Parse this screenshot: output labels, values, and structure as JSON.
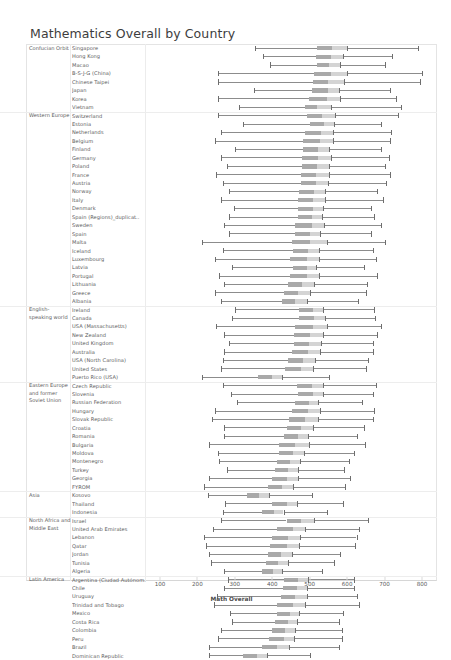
{
  "title": "Mathematics Overall by Country",
  "axis": {
    "label": "Math Overall",
    "ticks": [
      100,
      200,
      300,
      400,
      500,
      600,
      700,
      800
    ],
    "min": 60,
    "max": 840
  },
  "colors": {
    "line": "#8c8c8c",
    "box": "#9a9a9a",
    "cap": "#6e6e6e",
    "grid": "#ececec",
    "text": "#5a5a5a"
  },
  "chart_data": {
    "type": "bar",
    "title": "Mathematics Overall by Country",
    "xlabel": "Math Overall",
    "ylabel": "",
    "xlim": [
      60,
      840
    ],
    "grid": false,
    "legend": "none",
    "note": "Horizontal range chart: each row shows low cap, an inter-quartile box, and a high cap for one country, grouped by region.",
    "groups": [
      {
        "group": "Confucian Orbit",
        "rows": [
          {
            "country": "Singapore",
            "low": 355,
            "box_start": 520,
            "box_end": 560,
            "mid_gap_end": 600,
            "high": 790
          },
          {
            "country": "Hong Kong",
            "low": 375,
            "box_start": 518,
            "box_end": 556,
            "mid_gap_end": 588,
            "high": 720
          },
          {
            "country": "Macao",
            "low": 395,
            "box_start": 520,
            "box_end": 552,
            "mid_gap_end": 582,
            "high": 700
          },
          {
            "country": "B-S-J-G (China)",
            "low": 255,
            "box_start": 512,
            "box_end": 556,
            "mid_gap_end": 600,
            "high": 800
          },
          {
            "country": "Chinese Taipei",
            "low": 255,
            "box_start": 508,
            "box_end": 548,
            "mid_gap_end": 592,
            "high": 795
          },
          {
            "country": "Japan",
            "low": 350,
            "box_start": 505,
            "box_end": 548,
            "mid_gap_end": 578,
            "high": 715
          },
          {
            "country": "Korea",
            "low": 255,
            "box_start": 498,
            "box_end": 545,
            "mid_gap_end": 580,
            "high": 730
          },
          {
            "country": "Vietnam",
            "low": 310,
            "box_start": 488,
            "box_end": 520,
            "mid_gap_end": 556,
            "high": 745
          }
        ]
      },
      {
        "group": "Western Europe",
        "rows": [
          {
            "country": "Switzerland",
            "low": 255,
            "box_start": 492,
            "box_end": 532,
            "mid_gap_end": 568,
            "high": 735
          },
          {
            "country": "Estonia",
            "low": 322,
            "box_start": 500,
            "box_end": 538,
            "mid_gap_end": 565,
            "high": 690
          },
          {
            "country": "Netherlands",
            "low": 262,
            "box_start": 488,
            "box_end": 530,
            "mid_gap_end": 562,
            "high": 718
          },
          {
            "country": "Belgium",
            "low": 248,
            "box_start": 482,
            "box_end": 528,
            "mid_gap_end": 562,
            "high": 715
          },
          {
            "country": "Finland",
            "low": 300,
            "box_start": 482,
            "box_end": 522,
            "mid_gap_end": 552,
            "high": 690
          },
          {
            "country": "Germany",
            "low": 262,
            "box_start": 480,
            "box_end": 522,
            "mid_gap_end": 556,
            "high": 712
          },
          {
            "country": "Poland",
            "low": 278,
            "box_start": 480,
            "box_end": 520,
            "mid_gap_end": 552,
            "high": 700
          },
          {
            "country": "France",
            "low": 250,
            "box_start": 478,
            "box_end": 518,
            "mid_gap_end": 552,
            "high": 715
          },
          {
            "country": "Austria",
            "low": 268,
            "box_start": 478,
            "box_end": 518,
            "mid_gap_end": 550,
            "high": 705
          },
          {
            "country": "Norway",
            "low": 285,
            "box_start": 472,
            "box_end": 512,
            "mid_gap_end": 542,
            "high": 680
          },
          {
            "country": "Italy",
            "low": 262,
            "box_start": 468,
            "box_end": 508,
            "mid_gap_end": 540,
            "high": 695
          },
          {
            "country": "Denmark",
            "low": 298,
            "box_start": 470,
            "box_end": 508,
            "mid_gap_end": 535,
            "high": 665
          },
          {
            "country": "Spain (Regions)_duplicat..",
            "low": 285,
            "box_start": 468,
            "box_end": 505,
            "mid_gap_end": 532,
            "high": 672
          },
          {
            "country": "Sweden",
            "low": 272,
            "box_start": 462,
            "box_end": 505,
            "mid_gap_end": 538,
            "high": 690
          },
          {
            "country": "Spain",
            "low": 285,
            "box_start": 462,
            "box_end": 500,
            "mid_gap_end": 528,
            "high": 665
          },
          {
            "country": "Malta",
            "low": 212,
            "box_start": 452,
            "box_end": 502,
            "mid_gap_end": 545,
            "high": 700
          },
          {
            "country": "Iceland",
            "low": 268,
            "box_start": 455,
            "box_end": 495,
            "mid_gap_end": 525,
            "high": 668
          },
          {
            "country": "Luxembourg",
            "low": 248,
            "box_start": 448,
            "box_end": 492,
            "mid_gap_end": 525,
            "high": 678
          },
          {
            "country": "Latvia",
            "low": 292,
            "box_start": 455,
            "box_end": 492,
            "mid_gap_end": 518,
            "high": 645
          },
          {
            "country": "Portugal",
            "low": 258,
            "box_start": 448,
            "box_end": 492,
            "mid_gap_end": 525,
            "high": 680
          },
          {
            "country": "Lithuania",
            "low": 272,
            "box_start": 442,
            "box_end": 480,
            "mid_gap_end": 512,
            "high": 652
          },
          {
            "country": "Greece",
            "low": 248,
            "box_start": 430,
            "box_end": 470,
            "mid_gap_end": 502,
            "high": 650
          },
          {
            "country": "Albania",
            "low": 262,
            "box_start": 425,
            "box_end": 462,
            "mid_gap_end": 492,
            "high": 630
          }
        ]
      },
      {
        "group": "English-speaking world",
        "rows": [
          {
            "country": "Ireland",
            "low": 300,
            "box_start": 472,
            "box_end": 508,
            "mid_gap_end": 535,
            "high": 672
          },
          {
            "country": "Canada",
            "low": 292,
            "box_start": 472,
            "box_end": 512,
            "mid_gap_end": 542,
            "high": 675
          },
          {
            "country": "USA (Massachusetts)",
            "low": 250,
            "box_start": 462,
            "box_end": 508,
            "mid_gap_end": 545,
            "high": 690
          },
          {
            "country": "New Zealand",
            "low": 272,
            "box_start": 458,
            "box_end": 500,
            "mid_gap_end": 535,
            "high": 680
          },
          {
            "country": "United Kingdom",
            "low": 285,
            "box_start": 458,
            "box_end": 498,
            "mid_gap_end": 530,
            "high": 668
          },
          {
            "country": "Australia",
            "low": 272,
            "box_start": 452,
            "box_end": 495,
            "mid_gap_end": 528,
            "high": 670
          },
          {
            "country": "USA (North Carolina)",
            "low": 268,
            "box_start": 442,
            "box_end": 482,
            "mid_gap_end": 515,
            "high": 655
          },
          {
            "country": "United States",
            "low": 262,
            "box_start": 435,
            "box_end": 478,
            "mid_gap_end": 510,
            "high": 650
          },
          {
            "country": "Puerto Rico (USA)",
            "low": 212,
            "box_start": 362,
            "box_end": 398,
            "mid_gap_end": 425,
            "high": 552
          }
        ]
      },
      {
        "group": "Eastern Europe and former Soviet Union",
        "rows": [
          {
            "country": "Czech Republic",
            "low": 268,
            "box_start": 465,
            "box_end": 505,
            "mid_gap_end": 535,
            "high": 678
          },
          {
            "country": "Slovenia",
            "low": 290,
            "box_start": 468,
            "box_end": 508,
            "mid_gap_end": 535,
            "high": 668
          },
          {
            "country": "Russian Federation",
            "low": 305,
            "box_start": 462,
            "box_end": 498,
            "mid_gap_end": 522,
            "high": 640
          },
          {
            "country": "Hungary",
            "low": 248,
            "box_start": 452,
            "box_end": 495,
            "mid_gap_end": 528,
            "high": 672
          },
          {
            "country": "Slovak Republic",
            "low": 238,
            "box_start": 445,
            "box_end": 488,
            "mid_gap_end": 522,
            "high": 668
          },
          {
            "country": "Croatia",
            "low": 272,
            "box_start": 440,
            "box_end": 478,
            "mid_gap_end": 508,
            "high": 645
          },
          {
            "country": "Romania",
            "low": 272,
            "box_start": 432,
            "box_end": 468,
            "mid_gap_end": 495,
            "high": 625
          },
          {
            "country": "Bulgaria",
            "low": 232,
            "box_start": 418,
            "box_end": 462,
            "mid_gap_end": 498,
            "high": 648
          },
          {
            "country": "Moldova",
            "low": 255,
            "box_start": 418,
            "box_end": 455,
            "mid_gap_end": 485,
            "high": 618
          },
          {
            "country": "Montenegro",
            "low": 258,
            "box_start": 412,
            "box_end": 448,
            "mid_gap_end": 475,
            "high": 605
          },
          {
            "country": "Turkey",
            "low": 278,
            "box_start": 408,
            "box_end": 442,
            "mid_gap_end": 468,
            "high": 592
          },
          {
            "country": "Georgia",
            "low": 232,
            "box_start": 398,
            "box_end": 438,
            "mid_gap_end": 468,
            "high": 608
          },
          {
            "country": "FYROM",
            "low": 218,
            "box_start": 388,
            "box_end": 425,
            "mid_gap_end": 455,
            "high": 595
          }
        ]
      },
      {
        "group": "Asia",
        "rows": [
          {
            "country": "Kosovo",
            "low": 228,
            "box_start": 332,
            "box_end": 365,
            "mid_gap_end": 390,
            "high": 505
          },
          {
            "country": "Thailand",
            "low": 275,
            "box_start": 400,
            "box_end": 438,
            "mid_gap_end": 465,
            "high": 590
          },
          {
            "country": "Indonesia",
            "low": 268,
            "box_start": 372,
            "box_end": 405,
            "mid_gap_end": 430,
            "high": 545
          }
        ]
      },
      {
        "group": "North Africa and Middle East",
        "rows": [
          {
            "country": "Israel",
            "low": 262,
            "box_start": 438,
            "box_end": 478,
            "mid_gap_end": 512,
            "high": 655
          },
          {
            "country": "United Arab Emirates",
            "low": 242,
            "box_start": 412,
            "box_end": 455,
            "mid_gap_end": 488,
            "high": 632
          },
          {
            "country": "Lebanon",
            "low": 218,
            "box_start": 398,
            "box_end": 442,
            "mid_gap_end": 475,
            "high": 625
          },
          {
            "country": "Qatar",
            "low": 222,
            "box_start": 395,
            "box_end": 438,
            "mid_gap_end": 472,
            "high": 620
          },
          {
            "country": "Jordan",
            "low": 232,
            "box_start": 388,
            "box_end": 422,
            "mid_gap_end": 452,
            "high": 582
          },
          {
            "country": "Tunisia",
            "low": 235,
            "box_start": 382,
            "box_end": 415,
            "mid_gap_end": 442,
            "high": 565
          },
          {
            "country": "Algeria",
            "low": 272,
            "box_start": 372,
            "box_end": 402,
            "mid_gap_end": 425,
            "high": 532
          }
        ]
      },
      {
        "group": "Latin America",
        "rows": [
          {
            "country": "Argentina (Ciudad Autónom...",
            "low": 282,
            "box_start": 432,
            "box_end": 468,
            "mid_gap_end": 495,
            "high": 618
          },
          {
            "country": "Chile",
            "low": 272,
            "box_start": 428,
            "box_end": 465,
            "mid_gap_end": 492,
            "high": 618
          },
          {
            "country": "Uruguay",
            "low": 252,
            "box_start": 422,
            "box_end": 462,
            "mid_gap_end": 492,
            "high": 625
          },
          {
            "country": "Trinidad and Tobago",
            "low": 245,
            "box_start": 412,
            "box_end": 455,
            "mid_gap_end": 488,
            "high": 632
          },
          {
            "country": "Mexico",
            "low": 288,
            "box_start": 412,
            "box_end": 448,
            "mid_gap_end": 472,
            "high": 588
          },
          {
            "country": "Costa Rica",
            "low": 292,
            "box_start": 408,
            "box_end": 442,
            "mid_gap_end": 465,
            "high": 578
          },
          {
            "country": "Colombia",
            "low": 262,
            "box_start": 398,
            "box_end": 435,
            "mid_gap_end": 462,
            "high": 585
          },
          {
            "country": "Peru",
            "low": 255,
            "box_start": 392,
            "box_end": 430,
            "mid_gap_end": 458,
            "high": 585
          },
          {
            "country": "Brazil",
            "low": 232,
            "box_start": 372,
            "box_end": 412,
            "mid_gap_end": 445,
            "high": 578
          },
          {
            "country": "Dominican Republic",
            "low": 230,
            "box_start": 322,
            "box_end": 358,
            "mid_gap_end": 385,
            "high": 500
          }
        ]
      }
    ]
  }
}
